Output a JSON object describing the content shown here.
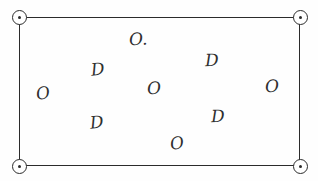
{
  "document": {
    "type": "hand-drawn survey sketch",
    "top_edge_cutoff_text": "",
    "ink_color": "#2f2f2f",
    "paper_color": "#fefefe"
  },
  "plot": {
    "shape_name": "rectangle",
    "border_color": "#2b2b2b"
  },
  "corner_markers": [
    {
      "name": "top-left",
      "symbol": "⊙"
    },
    {
      "name": "top-right",
      "symbol": "⊙"
    },
    {
      "name": "bottom-left",
      "symbol": "⊙"
    },
    {
      "name": "bottom-right",
      "symbol": "⊙"
    }
  ],
  "annotations": [
    {
      "id": "a1",
      "text": "O.",
      "x": 129,
      "y": 31,
      "tilt": "tilt-b"
    },
    {
      "id": "a2",
      "text": "D",
      "x": 91,
      "y": 61,
      "tilt": "tilt-a"
    },
    {
      "id": "a3",
      "text": "D",
      "x": 205,
      "y": 52,
      "tilt": "tilt-b"
    },
    {
      "id": "a4",
      "text": "O",
      "x": 36,
      "y": 85,
      "tilt": "tilt-c"
    },
    {
      "id": "a5",
      "text": "O",
      "x": 147,
      "y": 80,
      "tilt": "tilt-b"
    },
    {
      "id": "a6",
      "text": "O",
      "x": 265,
      "y": 78,
      "tilt": "tilt-b"
    },
    {
      "id": "a7",
      "text": "D",
      "x": 90,
      "y": 114,
      "tilt": "tilt-a"
    },
    {
      "id": "a8",
      "text": "D",
      "x": 211,
      "y": 108,
      "tilt": "tilt-b"
    },
    {
      "id": "a9",
      "text": "O",
      "x": 170,
      "y": 135,
      "tilt": "tilt-c"
    }
  ]
}
